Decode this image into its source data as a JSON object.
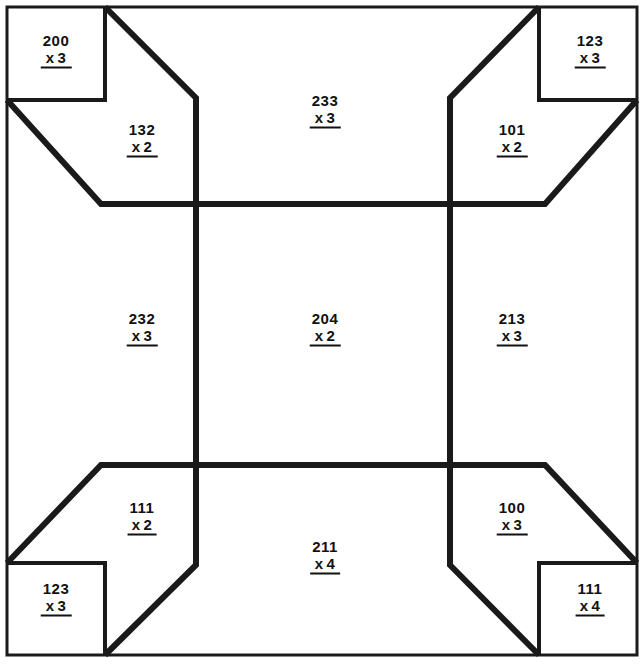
{
  "page": {
    "width": 644,
    "height": 664,
    "background_color": "#ffffff",
    "line_color": "#1a1a1a",
    "text_color": "#111111"
  },
  "problems": [
    {
      "id": "corner-top-left",
      "region": "corner",
      "position": "top-left",
      "top": "200",
      "operator": "x",
      "bottom": "3",
      "x": 56,
      "y": 50
    },
    {
      "id": "corner-top-right",
      "region": "corner",
      "position": "top-right",
      "top": "123",
      "operator": "x",
      "bottom": "3",
      "x": 590,
      "y": 50
    },
    {
      "id": "corner-bottom-left",
      "region": "corner",
      "position": "bottom-left",
      "top": "123",
      "operator": "x",
      "bottom": "3",
      "x": 56,
      "y": 598
    },
    {
      "id": "corner-bottom-right",
      "region": "corner",
      "position": "bottom-right",
      "top": "111",
      "operator": "x",
      "bottom": "4",
      "x": 590,
      "y": 598
    },
    {
      "id": "cell-top-left",
      "region": "grid",
      "position": "top-left",
      "top": "132",
      "operator": "x",
      "bottom": "2",
      "x": 142,
      "y": 139
    },
    {
      "id": "cell-top-center",
      "region": "grid",
      "position": "top-center",
      "top": "233",
      "operator": "x",
      "bottom": "3",
      "x": 325,
      "y": 110
    },
    {
      "id": "cell-top-right",
      "region": "grid",
      "position": "top-right",
      "top": "101",
      "operator": "x",
      "bottom": "2",
      "x": 512,
      "y": 139
    },
    {
      "id": "cell-middle-left",
      "region": "grid",
      "position": "middle-left",
      "top": "232",
      "operator": "x",
      "bottom": "3",
      "x": 142,
      "y": 328
    },
    {
      "id": "cell-middle-center",
      "region": "grid",
      "position": "middle-center",
      "top": "204",
      "operator": "x",
      "bottom": "2",
      "x": 325,
      "y": 328
    },
    {
      "id": "cell-middle-right",
      "region": "grid",
      "position": "middle-right",
      "top": "213",
      "operator": "x",
      "bottom": "3",
      "x": 512,
      "y": 328
    },
    {
      "id": "cell-bottom-left",
      "region": "grid",
      "position": "bottom-left",
      "top": "111",
      "operator": "x",
      "bottom": "2",
      "x": 142,
      "y": 517
    },
    {
      "id": "cell-bottom-center",
      "region": "grid",
      "position": "bottom-center",
      "top": "211",
      "operator": "x",
      "bottom": "4",
      "x": 325,
      "y": 556
    },
    {
      "id": "cell-bottom-right",
      "region": "grid",
      "position": "bottom-right",
      "top": "100",
      "operator": "x",
      "bottom": "3",
      "x": 512,
      "y": 517
    }
  ]
}
